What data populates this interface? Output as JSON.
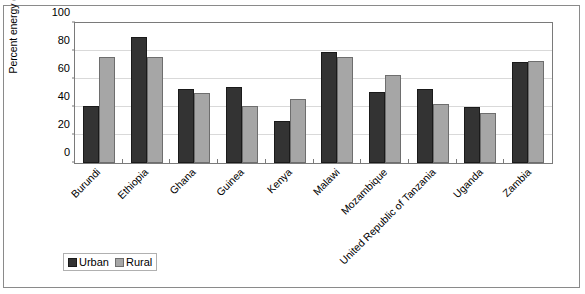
{
  "chart_data": {
    "type": "bar",
    "title": "",
    "xlabel": "",
    "ylabel": "Percent energy deficient",
    "ylim": [
      0,
      100
    ],
    "yticks": [
      0,
      20,
      40,
      60,
      80,
      100
    ],
    "ytick_labels": [
      "0",
      "20",
      "40",
      "60",
      "80",
      "100"
    ],
    "grid": true,
    "legend_position": "bottom-left",
    "categories": [
      "Burundi",
      "Ethiopia",
      "Ghana",
      "Guinea",
      "Kenya",
      "Malawi",
      "Mozambique",
      "United Republic of Tanzania",
      "Uganda",
      "Zambia"
    ],
    "series": [
      {
        "name": "Urban",
        "color": "#333333",
        "values": [
          41,
          90,
          53,
          54,
          30,
          79,
          51,
          53,
          40,
          72
        ]
      },
      {
        "name": "Rural",
        "color": "#a6a6a6",
        "values": [
          76,
          76,
          50,
          41,
          46,
          76,
          63,
          42,
          36,
          73
        ]
      }
    ]
  },
  "legend": {
    "entries": [
      {
        "label": "Urban",
        "swatch": "urban"
      },
      {
        "label": "Rural",
        "swatch": "rural"
      }
    ]
  }
}
